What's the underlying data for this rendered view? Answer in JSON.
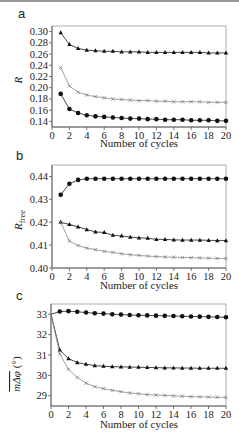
{
  "chart_data": [
    {
      "panel": "a",
      "type": "line",
      "title": "",
      "xlabel": "Number of cycles",
      "ylabel": "R",
      "xlim": [
        0,
        20
      ],
      "ylim": [
        0.13,
        0.31
      ],
      "xticks": [
        0,
        2,
        4,
        6,
        8,
        10,
        12,
        14,
        16,
        18,
        20
      ],
      "yticks": [
        0.14,
        0.16,
        0.18,
        0.2,
        0.22,
        0.24,
        0.26,
        0.28,
        0.3
      ],
      "ytick_labels": [
        "0.14",
        "0.16",
        "0.18",
        "0.20",
        "0.22",
        "0.24",
        "0.26",
        "0.28",
        "0.30"
      ],
      "grid": false,
      "legend": null,
      "x": [
        1,
        2,
        3,
        4,
        5,
        6,
        7,
        8,
        9,
        10,
        11,
        12,
        13,
        14,
        15,
        16,
        17,
        18,
        19,
        20
      ],
      "series": [
        {
          "name": "triangle",
          "marker": "triangle",
          "values": [
            0.298,
            0.277,
            0.27,
            0.267,
            0.266,
            0.265,
            0.265,
            0.264,
            0.264,
            0.264,
            0.263,
            0.263,
            0.263,
            0.263,
            0.263,
            0.263,
            0.263,
            0.262,
            0.262,
            0.262
          ]
        },
        {
          "name": "cross",
          "marker": "cross",
          "values": [
            0.236,
            0.203,
            0.192,
            0.187,
            0.184,
            0.182,
            0.18,
            0.179,
            0.178,
            0.177,
            0.177,
            0.176,
            0.176,
            0.175,
            0.175,
            0.175,
            0.175,
            0.174,
            0.174,
            0.174
          ]
        },
        {
          "name": "circle",
          "marker": "circle",
          "values": [
            0.189,
            0.162,
            0.155,
            0.151,
            0.149,
            0.148,
            0.147,
            0.146,
            0.145,
            0.145,
            0.144,
            0.144,
            0.143,
            0.143,
            0.143,
            0.142,
            0.142,
            0.142,
            0.141,
            0.141
          ]
        }
      ]
    },
    {
      "panel": "b",
      "type": "line",
      "title": "",
      "xlabel": "Number of cycles",
      "ylabel": "R_free",
      "xlim": [
        0,
        20
      ],
      "ylim": [
        0.4,
        0.445
      ],
      "xticks": [
        0,
        2,
        4,
        6,
        8,
        10,
        12,
        14,
        16,
        18,
        20
      ],
      "yticks": [
        0.4,
        0.41,
        0.42,
        0.43,
        0.44
      ],
      "ytick_labels": [
        "0.40",
        "0.41",
        "0.42",
        "0.43",
        "0.44"
      ],
      "grid": false,
      "legend": null,
      "x": [
        1,
        2,
        3,
        4,
        5,
        6,
        7,
        8,
        9,
        10,
        11,
        12,
        13,
        14,
        15,
        16,
        17,
        18,
        19,
        20
      ],
      "series": [
        {
          "name": "circle",
          "marker": "circle",
          "values": [
            0.432,
            0.4368,
            0.4385,
            0.439,
            0.439,
            0.439,
            0.439,
            0.439,
            0.439,
            0.439,
            0.439,
            0.439,
            0.439,
            0.439,
            0.439,
            0.439,
            0.439,
            0.439,
            0.439,
            0.439
          ]
        },
        {
          "name": "triangle",
          "marker": "triangle",
          "values": [
            0.42,
            0.419,
            0.418,
            0.4168,
            0.4158,
            0.4155,
            0.4143,
            0.414,
            0.4135,
            0.4132,
            0.413,
            0.4125,
            0.4125,
            0.4123,
            0.4122,
            0.4122,
            0.4122,
            0.4121,
            0.412,
            0.412
          ]
        },
        {
          "name": "cross",
          "marker": "cross",
          "values": [
            0.42,
            0.4118,
            0.4098,
            0.4087,
            0.408,
            0.4073,
            0.4068,
            0.4062,
            0.4058,
            0.4055,
            0.4052,
            0.405,
            0.4048,
            0.4047,
            0.4046,
            0.4045,
            0.4044,
            0.4043,
            0.4042,
            0.4041
          ]
        }
      ]
    },
    {
      "panel": "c",
      "type": "line",
      "title": "",
      "xlabel": "Number of cycles",
      "ylabel": "mΔφ (°)",
      "xlim": [
        0,
        20
      ],
      "ylim": [
        28.5,
        33.5
      ],
      "xticks": [
        0,
        2,
        4,
        6,
        8,
        10,
        12,
        14,
        16,
        18,
        20
      ],
      "yticks": [
        29,
        30,
        31,
        32,
        33
      ],
      "ytick_labels": [
        "29",
        "30",
        "31",
        "32",
        "33"
      ],
      "grid": false,
      "legend": null,
      "x": [
        0,
        1,
        2,
        3,
        4,
        5,
        6,
        7,
        8,
        9,
        10,
        11,
        12,
        13,
        14,
        15,
        16,
        17,
        18,
        19,
        20
      ],
      "series": [
        {
          "name": "circle",
          "marker": "circle",
          "values": [
            33.0,
            33.13,
            33.15,
            33.12,
            33.08,
            33.05,
            33.03,
            33.0,
            32.98,
            32.96,
            32.95,
            32.94,
            32.93,
            32.92,
            32.91,
            32.9,
            32.89,
            32.88,
            32.87,
            32.86,
            32.85
          ]
        },
        {
          "name": "triangle",
          "marker": "triangle",
          "values": [
            33.0,
            31.25,
            30.82,
            30.63,
            30.55,
            30.48,
            30.45,
            30.43,
            30.42,
            30.41,
            30.4,
            30.39,
            30.38,
            30.37,
            30.37,
            30.36,
            30.36,
            30.35,
            30.35,
            30.35,
            30.35
          ]
        },
        {
          "name": "cross",
          "marker": "cross",
          "values": [
            33.0,
            31.05,
            30.3,
            29.9,
            29.62,
            29.45,
            29.35,
            29.27,
            29.2,
            29.14,
            29.1,
            29.06,
            29.04,
            29.02,
            29.0,
            28.98,
            28.96,
            28.95,
            28.94,
            28.93,
            28.92
          ]
        }
      ]
    }
  ],
  "panels": {
    "a": {
      "label": "a",
      "ylabel": "R",
      "xlabel": "Number of cycles"
    },
    "b": {
      "label": "b",
      "ylabel_main": "R",
      "ylabel_sub": "free",
      "xlabel": "Number of cycles"
    },
    "c": {
      "label": "c",
      "ylabel_main": "mΔφ",
      "ylabel_unit": "(°)",
      "xlabel": "Number of cycles"
    }
  },
  "xtick_labels": [
    "0",
    "2",
    "4",
    "6",
    "8",
    "10",
    "12",
    "14",
    "16",
    "18",
    "20"
  ]
}
